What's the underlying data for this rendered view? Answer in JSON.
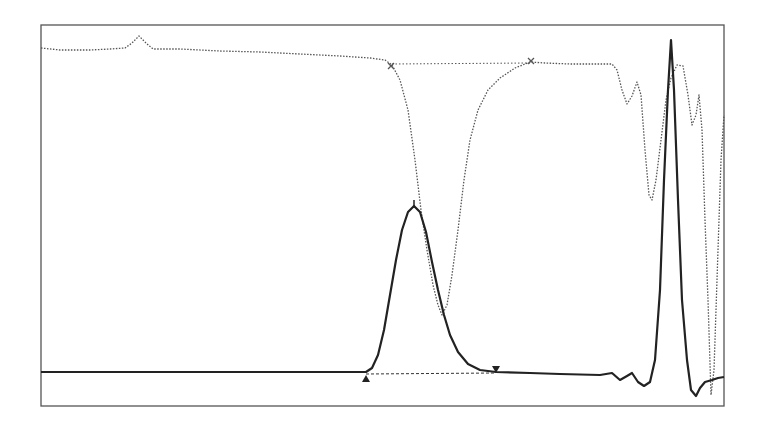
{
  "chart_data": {
    "type": "line",
    "title": "",
    "xlabel": "",
    "ylabel": "",
    "grid": false,
    "legend": "none",
    "frame": {
      "x": 41,
      "y": 25,
      "w": 683,
      "h": 381
    },
    "colors": {
      "frame": "#555555",
      "solid": "#222222",
      "dotted": "#555555",
      "baseline": "#333333"
    },
    "series": [
      {
        "name": "dotted-trace",
        "style": "dotted",
        "points": [
          [
            41,
            48
          ],
          [
            60,
            50
          ],
          [
            90,
            50
          ],
          [
            110,
            49
          ],
          [
            125,
            48
          ],
          [
            132,
            43
          ],
          [
            139,
            36
          ],
          [
            146,
            43
          ],
          [
            153,
            49
          ],
          [
            180,
            49
          ],
          [
            220,
            51
          ],
          [
            260,
            52
          ],
          [
            300,
            54
          ],
          [
            340,
            56
          ],
          [
            370,
            58
          ],
          [
            385,
            60
          ],
          [
            392,
            65
          ],
          [
            400,
            80
          ],
          [
            408,
            110
          ],
          [
            415,
            160
          ],
          [
            421,
            210
          ],
          [
            427,
            250
          ],
          [
            433,
            285
          ],
          [
            438,
            305
          ],
          [
            442,
            315
          ],
          [
            447,
            305
          ],
          [
            452,
            275
          ],
          [
            458,
            230
          ],
          [
            464,
            180
          ],
          [
            470,
            140
          ],
          [
            478,
            110
          ],
          [
            488,
            90
          ],
          [
            500,
            78
          ],
          [
            515,
            68
          ],
          [
            530,
            62
          ],
          [
            545,
            63
          ],
          [
            570,
            64
          ],
          [
            600,
            64
          ],
          [
            612,
            64
          ],
          [
            617,
            70
          ],
          [
            622,
            90
          ],
          [
            627,
            104
          ],
          [
            632,
            96
          ],
          [
            637,
            82
          ],
          [
            641,
            95
          ],
          [
            645,
            150
          ],
          [
            649,
            195
          ],
          [
            652,
            200
          ],
          [
            656,
            180
          ],
          [
            661,
            140
          ],
          [
            666,
            100
          ],
          [
            671,
            78
          ],
          [
            677,
            65
          ],
          [
            683,
            66
          ],
          [
            688,
            95
          ],
          [
            692,
            125
          ],
          [
            696,
            115
          ],
          [
            699,
            95
          ],
          [
            702,
            130
          ],
          [
            705,
            220
          ],
          [
            708,
            300
          ],
          [
            711,
            395
          ],
          [
            714,
            370
          ],
          [
            718,
            250
          ],
          [
            721,
            160
          ],
          [
            724,
            115
          ]
        ]
      },
      {
        "name": "solid-trace",
        "style": "solid",
        "points": [
          [
            41,
            372
          ],
          [
            100,
            372
          ],
          [
            200,
            372
          ],
          [
            300,
            372
          ],
          [
            350,
            372
          ],
          [
            366,
            372
          ],
          [
            372,
            368
          ],
          [
            378,
            355
          ],
          [
            384,
            330
          ],
          [
            390,
            295
          ],
          [
            396,
            260
          ],
          [
            402,
            230
          ],
          [
            408,
            212
          ],
          [
            414,
            206
          ],
          [
            420,
            212
          ],
          [
            426,
            232
          ],
          [
            432,
            262
          ],
          [
            438,
            290
          ],
          [
            444,
            315
          ],
          [
            450,
            335
          ],
          [
            458,
            352
          ],
          [
            468,
            364
          ],
          [
            480,
            370
          ],
          [
            496,
            372
          ],
          [
            530,
            373
          ],
          [
            560,
            374
          ],
          [
            600,
            375
          ],
          [
            612,
            373
          ],
          [
            620,
            380
          ],
          [
            627,
            376
          ],
          [
            632,
            373
          ],
          [
            638,
            382
          ],
          [
            644,
            386
          ],
          [
            650,
            382
          ],
          [
            655,
            360
          ],
          [
            660,
            290
          ],
          [
            664,
            180
          ],
          [
            668,
            90
          ],
          [
            671,
            40
          ],
          [
            674,
            90
          ],
          [
            678,
            200
          ],
          [
            682,
            300
          ],
          [
            687,
            360
          ],
          [
            691,
            390
          ],
          [
            696,
            396
          ],
          [
            700,
            388
          ],
          [
            705,
            382
          ],
          [
            712,
            380
          ],
          [
            718,
            378
          ],
          [
            724,
            377
          ]
        ]
      },
      {
        "name": "baseline-dashed",
        "style": "dashed",
        "points": [
          [
            366,
            374
          ],
          [
            496,
            373
          ]
        ]
      },
      {
        "name": "dotted-baseline",
        "style": "dashed-light",
        "points": [
          [
            392,
            64
          ],
          [
            530,
            63
          ]
        ]
      }
    ],
    "markers": [
      {
        "name": "peak-start-marker",
        "shape": "triangle-up",
        "x": 366,
        "y": 378
      },
      {
        "name": "peak-end-marker",
        "shape": "triangle-down",
        "x": 496,
        "y": 369
      },
      {
        "name": "peak-apex-tick",
        "shape": "tick",
        "x": 414,
        "y": 200
      },
      {
        "name": "dip-start-marker",
        "shape": "x",
        "x": 391,
        "y": 66
      },
      {
        "name": "dip-end-marker",
        "shape": "x",
        "x": 531,
        "y": 61
      }
    ]
  }
}
